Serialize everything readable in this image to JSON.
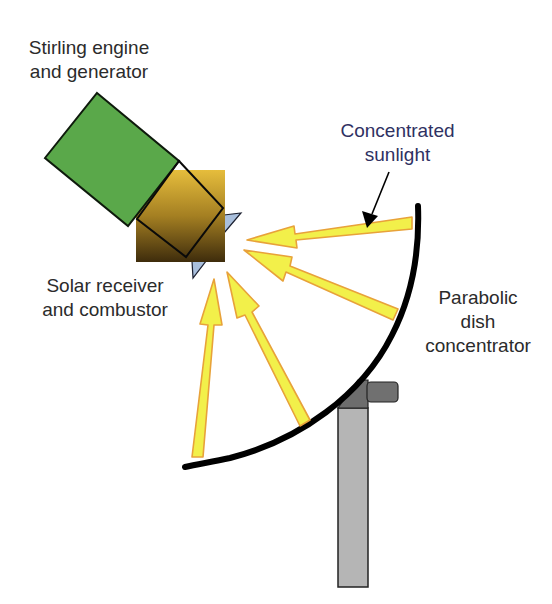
{
  "diagram": {
    "labels": {
      "engine": {
        "line1": "Stirling engine",
        "line2": "and generator"
      },
      "sunlight": {
        "line1": "Concentrated",
        "line2": "sunlight"
      },
      "receiver": {
        "line1": "Solar receiver",
        "line2": "and combustor"
      },
      "dish": {
        "line1": "Parabolic",
        "line2": "dish",
        "line3": "concentrator"
      }
    },
    "components": [
      {
        "id": "stirling-engine",
        "shape": "rotated-rectangle",
        "color": "#5aa84a"
      },
      {
        "id": "solar-receiver",
        "shape": "square-gradient",
        "color_top": "#e2b83a",
        "color_bottom": "#4a3510"
      },
      {
        "id": "receiver-fins",
        "shape": "triangles",
        "color": "#a9bfdc"
      },
      {
        "id": "parabolic-dish",
        "shape": "curve",
        "color": "#000000"
      },
      {
        "id": "stand-pole",
        "shape": "rectangle",
        "color": "#b3b3b3"
      },
      {
        "id": "stand-bracket",
        "shape": "polygon",
        "color": "#6f6f6f"
      }
    ],
    "sunlight_rays": {
      "count": 4,
      "fill": "#f2f04a",
      "stroke": "#e8a23a"
    },
    "colors": {
      "text": "#2b2b2b",
      "callout_text": "#2f3162"
    }
  }
}
